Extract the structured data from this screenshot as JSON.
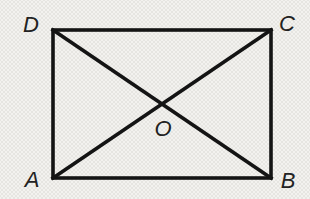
{
  "figure": {
    "labels": {
      "top_left": "D",
      "top_right": "C",
      "bottom_left": "A",
      "bottom_right": "B",
      "intersection": "O"
    },
    "colors": {
      "line": "#141414",
      "background": "#f3f2ef",
      "dot_texture": "#e6e5e1",
      "label": "#222222"
    }
  }
}
